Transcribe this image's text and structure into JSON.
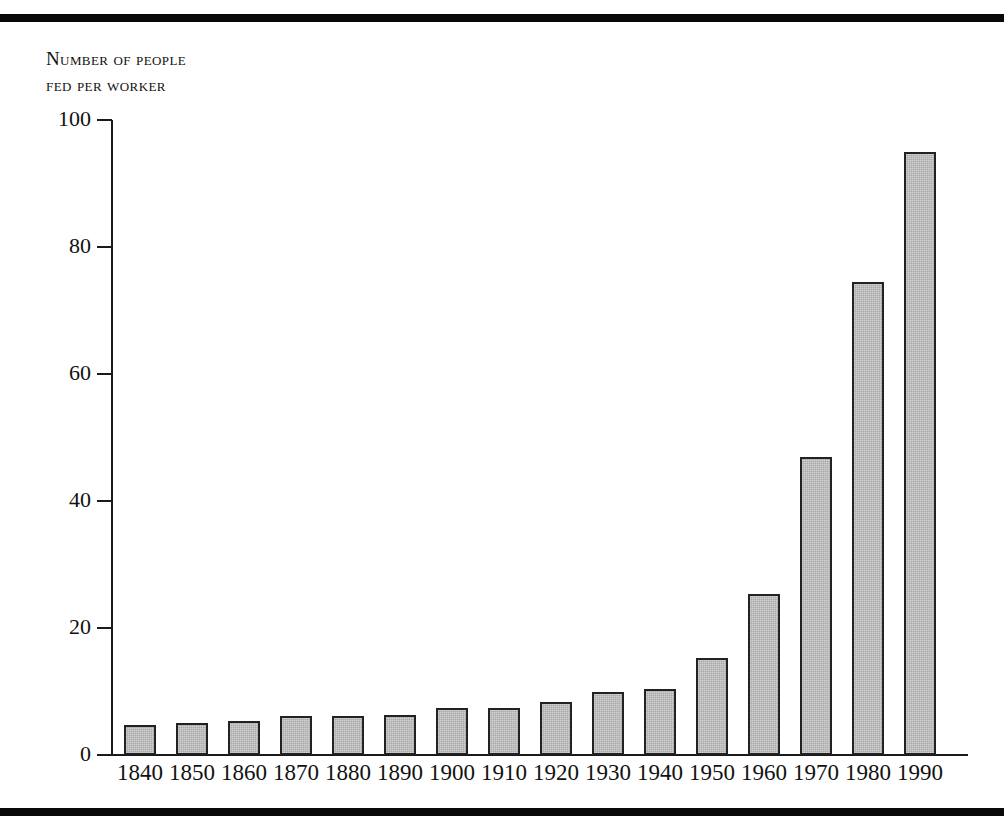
{
  "figure": {
    "background_color": "#ffffff",
    "rule_color": "#090909",
    "bar_fill_color": "#a9a9a9",
    "bar_border_color": "#222222",
    "axis_color": "#1a1a1a"
  },
  "chart_data": {
    "type": "bar",
    "title": "",
    "subtitle": "",
    "xlabel": "",
    "ylabel": "Number of people fed per worker",
    "ylabel_lines": [
      "Number of people",
      "fed per worker"
    ],
    "categories": [
      "1840",
      "1850",
      "1860",
      "1870",
      "1880",
      "1890",
      "1900",
      "1910",
      "1920",
      "1930",
      "1940",
      "1950",
      "1960",
      "1970",
      "1980",
      "1990"
    ],
    "values": [
      4.7,
      5.0,
      5.4,
      6.2,
      6.2,
      6.3,
      7.4,
      7.4,
      8.4,
      10.0,
      10.4,
      15.3,
      25.4,
      47.0,
      74.5,
      95.0
    ],
    "ylim": [
      0,
      100
    ],
    "yticks": [
      0,
      20,
      40,
      60,
      80,
      100
    ],
    "ytick_labels": [
      "0",
      "20",
      "40",
      "60",
      "80",
      "100"
    ],
    "grid": false,
    "legend": null,
    "legend_position": "none",
    "annotations": []
  }
}
